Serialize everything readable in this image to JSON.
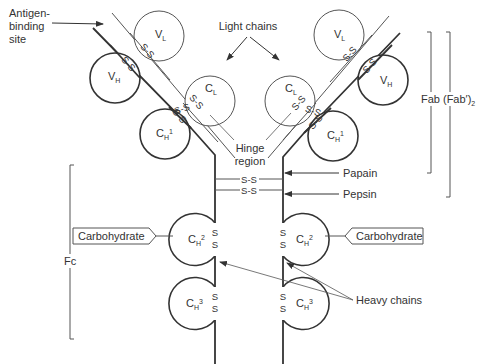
{
  "diagram": {
    "labels": {
      "antigen_binding_site": [
        "Antigen-",
        "binding",
        "site"
      ],
      "light_chains": "Light chains",
      "hinge_region": [
        "Hinge",
        "region"
      ],
      "papain": "Papain",
      "pepsin": "Pepsin",
      "heavy_chains": "Heavy chains",
      "fab": "Fab",
      "fab2": "(Fab′)",
      "fab2_sub": "2",
      "fc": "Fc",
      "carbohydrate_left": "Carbohydrate",
      "carbohydrate_right": "Carbohydrate"
    },
    "domains": {
      "vl_main": "V",
      "vl_sub": "L",
      "vh_main": "V",
      "vh_sub": "H",
      "cl_main": "C",
      "cl_sub": "L",
      "ch1_main": "C",
      "ch1_sub": "H",
      "ch1_sup": "1",
      "ch2_main": "C",
      "ch2_sub": "H",
      "ch2_sup": "2",
      "ch3_main": "C",
      "ch3_sub": "H",
      "ch3_sup": "3"
    },
    "disulfide": {
      "ss": "S-S",
      "s": "S"
    },
    "colors": {
      "stroke": "#333333",
      "thin_stroke": "#555555",
      "background": "#ffffff"
    }
  }
}
